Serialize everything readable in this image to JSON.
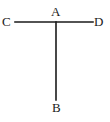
{
  "figure": {
    "type": "geometry-diagram",
    "background_color": "#ffffff",
    "stroke_color": "#1a1a1a",
    "label_color": "#1a1a1a",
    "canvas": {
      "width": 110,
      "height": 122
    }
  },
  "segments": [
    {
      "name": "horizontal-segment-CD",
      "from": "C",
      "to": "D",
      "x1": 15,
      "y1": 22,
      "x2": 93,
      "y2": 22,
      "stroke_width": 1.6
    },
    {
      "name": "vertical-segment-AB",
      "from": "A",
      "to": "B",
      "x1": 56,
      "y1": 22,
      "x2": 56,
      "y2": 100,
      "stroke_width": 1.6
    }
  ],
  "points": [
    {
      "id": "A",
      "label": "A",
      "x": 56,
      "y": 22,
      "label_position": "above"
    },
    {
      "id": "B",
      "label": "B",
      "x": 56,
      "y": 100,
      "label_position": "below"
    },
    {
      "id": "C",
      "label": "C",
      "x": 15,
      "y": 22,
      "label_position": "left"
    },
    {
      "id": "D",
      "label": "D",
      "x": 93,
      "y": 22,
      "label_position": "right"
    }
  ]
}
